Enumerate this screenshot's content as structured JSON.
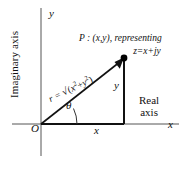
{
  "figure": {
    "axes": {
      "imaginary_axis_label": "Imaginary axis",
      "real_axis_label_line1": "Real",
      "real_axis_label_line2": "axis",
      "vertical_tip_letter": "y",
      "horizontal_tip_letter": "x",
      "origin_label": "O"
    },
    "labels": {
      "leg_horizontal": "x",
      "leg_vertical": "y",
      "angle": "θ",
      "point_line1": "P : (x,y), representing",
      "point_line2": "z=x+jy",
      "radius_prefix": "r = ",
      "radius_radical": "√",
      "radius_expression_open": "(",
      "radius_term1_base": "x",
      "radius_term1_exp": "2",
      "radius_plus": "+",
      "radius_term2_base": "y",
      "radius_term2_exp": "2",
      "radius_expression_close": ")"
    },
    "colors": {
      "axis": "#555555",
      "triangle": "#111111",
      "arc": "#333333",
      "point": "#000000",
      "background": "#ffffff"
    },
    "geometry": {
      "origin_x": 41,
      "origin_y": 124,
      "point_x": 124,
      "point_y": 58,
      "x_axis_start": 12,
      "x_axis_end": 179,
      "y_axis_top": 8,
      "y_axis_bottom": 156,
      "arc_radius": 36
    }
  }
}
